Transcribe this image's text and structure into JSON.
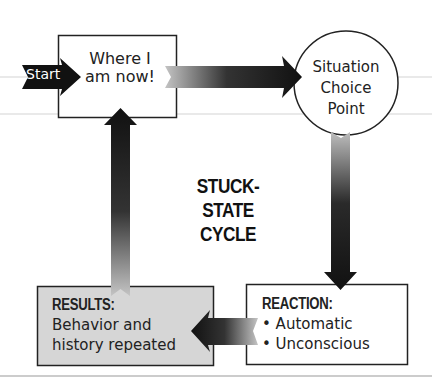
{
  "title": {
    "line1": "STUCK- STATE",
    "line2": "CYCLE"
  },
  "start_arrow": {
    "label": "Start"
  },
  "nodes": {
    "current": {
      "line1": "Where I",
      "line2": "am now!"
    },
    "situation": {
      "line1": "Situation",
      "line2": "Choice",
      "line3": "Point"
    },
    "reaction": {
      "heading": "REACTION:",
      "items": [
        "• Automatic",
        "• Unconscious"
      ]
    },
    "results": {
      "heading": "RESULTS:",
      "line1": "Behavior and",
      "line2": "history repeated"
    }
  },
  "edges": [
    {
      "from": "current",
      "to": "situation",
      "direction": "right"
    },
    {
      "from": "situation",
      "to": "reaction",
      "direction": "down"
    },
    {
      "from": "reaction",
      "to": "results",
      "direction": "left"
    },
    {
      "from": "results",
      "to": "current",
      "direction": "up"
    }
  ],
  "colors": {
    "stroke": "#222222",
    "results_fill": "#d9d9d9",
    "arrow_dark": "#111111",
    "arrow_light": "#bdbdbd",
    "guide_line": "#cfcfcf"
  }
}
